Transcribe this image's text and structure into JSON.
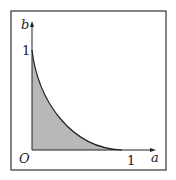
{
  "diagram": {
    "type": "function-region-plot",
    "axes": {
      "x_label": "a",
      "y_label": "b",
      "origin_label": "O",
      "x_tick_label": "1",
      "y_tick_label": "1"
    },
    "curve": {
      "description": "convex decreasing curve from (0,1) to (1,0)",
      "start": [
        0,
        1
      ],
      "end": [
        1,
        0
      ]
    },
    "region": {
      "description": "shaded area under curve in first quadrant",
      "fill_color": "#b8b8b8"
    },
    "colors": {
      "frame": "#333333",
      "axis": "#222222",
      "curve": "#222222"
    }
  }
}
